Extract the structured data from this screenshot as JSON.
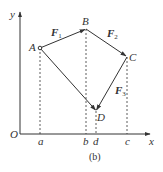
{
  "figure": {
    "caption": "(b)",
    "axes": {
      "origin_label": "O",
      "x_label": "x",
      "y_label": "y"
    },
    "points": [
      {
        "id": "A",
        "label": "A",
        "x": 40,
        "y": 48
      },
      {
        "id": "B",
        "label": "B",
        "x": 86,
        "y": 29
      },
      {
        "id": "C",
        "label": "C",
        "x": 127,
        "y": 57
      },
      {
        "id": "D",
        "label": "D",
        "x": 96,
        "y": 111
      }
    ],
    "x_ticks": [
      {
        "label": "a",
        "x": 40
      },
      {
        "label": "b",
        "x": 86
      },
      {
        "label": "d",
        "x": 96
      },
      {
        "label": "c",
        "x": 127
      }
    ],
    "vectors": [
      {
        "name": "F",
        "subscript": "1",
        "from": "A",
        "to": "B"
      },
      {
        "name": "F",
        "subscript": "2",
        "from": "B",
        "to": "C"
      },
      {
        "name": "F",
        "subscript": "3",
        "from": "C",
        "to": "D"
      },
      {
        "name": "",
        "subscript": "",
        "from": "A",
        "to": "D"
      }
    ],
    "colors": {
      "stroke": "#333333",
      "background": "#ffffff"
    }
  }
}
